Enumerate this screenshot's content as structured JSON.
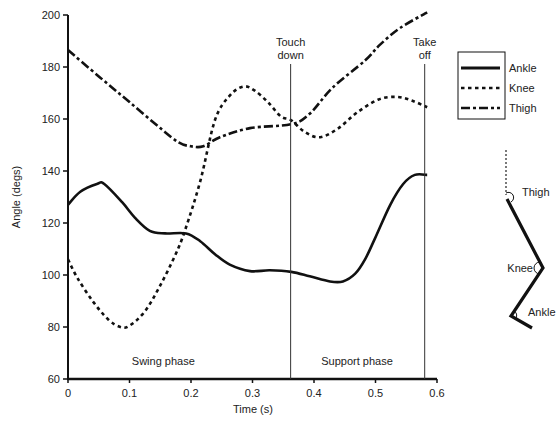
{
  "chart_data": {
    "type": "line",
    "title": "",
    "xlabel": "Time (s)",
    "ylabel": "Angle (degs)",
    "xlim": [
      0,
      0.6
    ],
    "ylim": [
      60,
      200
    ],
    "xticks": [
      "0",
      "0.1",
      "0.2",
      "0.3",
      "0.4",
      "0.5",
      "0.6"
    ],
    "yticks": [
      "60",
      "80",
      "100",
      "120",
      "140",
      "160",
      "180",
      "200"
    ],
    "grid": false,
    "legend_position": "right-upper",
    "series": [
      {
        "name": "Ankle",
        "style": "solid",
        "points": [
          [
            0,
            127
          ],
          [
            0.02,
            132
          ],
          [
            0.047,
            135
          ],
          [
            0.059,
            135
          ],
          [
            0.088,
            128
          ],
          [
            0.109,
            122
          ],
          [
            0.133,
            117
          ],
          [
            0.158,
            116
          ],
          [
            0.192,
            116
          ],
          [
            0.215,
            113
          ],
          [
            0.239,
            108
          ],
          [
            0.263,
            104
          ],
          [
            0.296,
            101.5
          ],
          [
            0.328,
            101.8
          ],
          [
            0.363,
            101.2
          ],
          [
            0.393,
            99.5
          ],
          [
            0.426,
            97.5
          ],
          [
            0.447,
            97.5
          ],
          [
            0.467,
            100.5
          ],
          [
            0.483,
            106
          ],
          [
            0.499,
            114
          ],
          [
            0.524,
            127
          ],
          [
            0.545,
            135
          ],
          [
            0.564,
            138.5
          ],
          [
            0.584,
            138.5
          ]
        ]
      },
      {
        "name": "Knee",
        "style": "dotted",
        "points": [
          [
            0,
            106
          ],
          [
            0.015,
            99
          ],
          [
            0.04,
            90
          ],
          [
            0.065,
            83
          ],
          [
            0.085,
            80
          ],
          [
            0.1,
            80.5
          ],
          [
            0.125,
            86
          ],
          [
            0.15,
            96
          ],
          [
            0.175,
            108
          ],
          [
            0.19,
            117
          ],
          [
            0.215,
            136
          ],
          [
            0.239,
            159.6
          ],
          [
            0.263,
            169
          ],
          [
            0.285,
            172.5
          ],
          [
            0.303,
            171
          ],
          [
            0.325,
            166.5
          ],
          [
            0.346,
            161
          ],
          [
            0.363,
            159.5
          ],
          [
            0.385,
            155
          ],
          [
            0.41,
            153
          ],
          [
            0.44,
            156.5
          ],
          [
            0.47,
            162.5
          ],
          [
            0.505,
            167.5
          ],
          [
            0.535,
            168.5
          ],
          [
            0.56,
            167
          ],
          [
            0.584,
            164.5
          ]
        ]
      },
      {
        "name": "Thigh",
        "style": "dash-dot",
        "points": [
          [
            0,
            186.5
          ],
          [
            0.052,
            176
          ],
          [
            0.1,
            166.5
          ],
          [
            0.15,
            156.5
          ],
          [
            0.18,
            151
          ],
          [
            0.2,
            149.5
          ],
          [
            0.22,
            149.5
          ],
          [
            0.247,
            153
          ],
          [
            0.296,
            156.5
          ],
          [
            0.363,
            158
          ],
          [
            0.393,
            162
          ],
          [
            0.43,
            172
          ],
          [
            0.483,
            182.5
          ],
          [
            0.507,
            188.5
          ],
          [
            0.54,
            195
          ],
          [
            0.584,
            201
          ]
        ]
      }
    ],
    "annotations": [
      {
        "type": "vline",
        "x": 0.362,
        "label": [
          "Touch",
          "down"
        ]
      },
      {
        "type": "vline",
        "x": 0.58,
        "label": [
          "Take",
          "off"
        ]
      },
      {
        "type": "text",
        "x": 0.155,
        "y": 67,
        "label": "Swing phase"
      },
      {
        "type": "text",
        "x": 0.47,
        "y": 67,
        "label": "Support phase"
      }
    ],
    "diagram": {
      "labels": [
        "Thigh",
        "Knee",
        "Ankle"
      ]
    }
  }
}
